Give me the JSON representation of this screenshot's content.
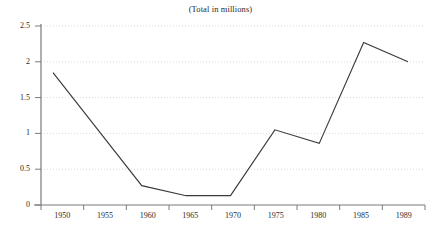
{
  "chart_data": {
    "type": "line",
    "title": "(Total in millions)",
    "xlabel": "",
    "ylabel": "",
    "categories": [
      "1950",
      "1955",
      "1960",
      "1965",
      "1970",
      "1975",
      "1980",
      "1985",
      "1989"
    ],
    "x": [
      1950,
      1955,
      1960,
      1965,
      1970,
      1975,
      1980,
      1985,
      1989
    ],
    "values": [
      1.85,
      1.06,
      0.27,
      0.13,
      0.13,
      1.05,
      0.86,
      2.27,
      2.0
    ],
    "series": [
      {
        "name": "Total in millions",
        "values": [
          1.85,
          1.06,
          0.27,
          0.13,
          0.13,
          1.05,
          0.86,
          2.27,
          2.0
        ]
      }
    ],
    "ylim": [
      0,
      2.5
    ],
    "xlim": [
      1950,
      1989
    ],
    "ytick_labels": [
      "0",
      "0.5",
      "1",
      "1.5",
      "2",
      "2.5"
    ],
    "ytick_values": [
      0,
      0.5,
      1,
      1.5,
      2,
      2.5
    ],
    "xtick_labels": [
      "1950",
      "1955",
      "1960",
      "1965",
      "1970",
      "1975",
      "1980",
      "1985",
      "1989"
    ],
    "grid": "horizontal-dotted",
    "legend": "none",
    "line_color": "#3a3a3a",
    "grid_color": "#cfcfcf",
    "axis_color": "#7a7a7a",
    "background_color": "#ffffff"
  }
}
